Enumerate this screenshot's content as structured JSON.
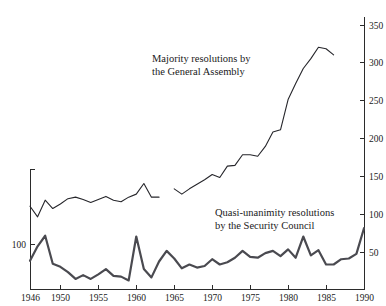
{
  "chart_data": {
    "type": "line",
    "title": "",
    "subtitle": "",
    "xlabel": "",
    "ylabel": "",
    "xlim": [
      1946,
      1990
    ],
    "ylim": [
      0,
      360
    ],
    "grid": false,
    "legend_position": "inline-annotations",
    "x_ticks": [
      1946,
      1950,
      1955,
      1960,
      1965,
      1970,
      1975,
      1980,
      1985,
      1990
    ],
    "x_tick_labels": [
      "1946",
      "1950",
      "1955",
      "1960",
      "1965",
      "1970",
      "1975",
      "1980",
      "1985",
      "1990"
    ],
    "right_axis_ticks": [
      50,
      100,
      150,
      200,
      250,
      300,
      350
    ],
    "right_axis_tick_labels": [
      "50",
      "100",
      "150",
      "200",
      "250",
      "300",
      "350"
    ],
    "left_axis_ticks": [
      100,
      150
    ],
    "left_axis_tick_labels": [
      "100",
      ""
    ],
    "left_axis_visible_label": "100",
    "annotations": [
      {
        "name": "majority-resolutions-label",
        "line1": "Majority resolutions by",
        "line2": "the General Assembly"
      },
      {
        "name": "quasi-unanimity-label",
        "line1": "Quasi-unanimity resolutions",
        "line2": "by the Security Council"
      }
    ],
    "series": [
      {
        "name": "Majority resolutions by the General Assembly",
        "style": "thin",
        "color": "#26262b",
        "x": [
          1946,
          1947,
          1948,
          1949,
          1950,
          1951,
          1952,
          1953,
          1954,
          1955,
          1956,
          1957,
          1958,
          1959,
          1960,
          1961,
          1962,
          1963,
          1965,
          1966,
          1967,
          1968,
          1969,
          1970,
          1971,
          1972,
          1973,
          1974,
          1975,
          1976,
          1977,
          1978,
          1979,
          1980,
          1981,
          1982,
          1983,
          1984,
          1985,
          1986
        ],
        "values": [
          110,
          96,
          118,
          107,
          113,
          120,
          122,
          119,
          115,
          119,
          123,
          118,
          116,
          122,
          126,
          140,
          122,
          122,
          133,
          126,
          133,
          139,
          145,
          152,
          148,
          163,
          164,
          178,
          178,
          176,
          189,
          208,
          211,
          251,
          272,
          292,
          305,
          320,
          318,
          310
        ],
        "gap_after_year": 1963
      },
      {
        "name": "Quasi-unanimity resolutions by the Security Council",
        "style": "thick",
        "color": "#4a4a50",
        "x": [
          1946,
          1947,
          1948,
          1949,
          1950,
          1951,
          1952,
          1953,
          1954,
          1955,
          1956,
          1957,
          1958,
          1959,
          1960,
          1961,
          1962,
          1963,
          1964,
          1965,
          1966,
          1967,
          1968,
          1969,
          1970,
          1971,
          1972,
          1973,
          1974,
          1975,
          1976,
          1977,
          1978,
          1979,
          1980,
          1981,
          1982,
          1983,
          1984,
          1985,
          1986,
          1987,
          1988,
          1989,
          1990
        ],
        "values": [
          38,
          57,
          71,
          34,
          30,
          23,
          14,
          19,
          14,
          20,
          27,
          18,
          17,
          12,
          70,
          27,
          16,
          37,
          51,
          41,
          28,
          33,
          29,
          31,
          40,
          33,
          36,
          42,
          51,
          43,
          42,
          48,
          51,
          44,
          53,
          42,
          70,
          45,
          52,
          33,
          33,
          40,
          41,
          47,
          81
        ],
        "gap_after_year": null
      }
    ]
  },
  "colors": {
    "background": "#ffffff",
    "axis": "#2b2b2b",
    "majority_line": "#26262b",
    "quasi_line": "#4a4a50",
    "text": "#1a1a1a"
  }
}
